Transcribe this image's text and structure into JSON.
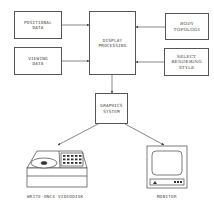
{
  "nodes": {
    "positional_data": "POSITIONAL\nDATA",
    "viewing_data": "VIEWING\nDATA",
    "display_processing": "DISPLAY\nPROCESSING",
    "body_topology": "BODY\nTOPOLOGY",
    "select_rendering_style": "SELECT\nRENDERING\nSTYLE",
    "graphics_system": "GRAPHICS\nSYSTEM"
  },
  "outputs": {
    "videodisk_label": "WRITE-ONCE VIDEODISK",
    "monitor_label": "MONITOR"
  },
  "edges": [
    {
      "from": "positional_data",
      "to": "display_processing"
    },
    {
      "from": "viewing_data",
      "to": "display_processing"
    },
    {
      "from": "body_topology",
      "to": "display_processing"
    },
    {
      "from": "select_rendering_style",
      "to": "display_processing"
    },
    {
      "from": "display_processing",
      "to": "graphics_system"
    },
    {
      "from": "graphics_system",
      "to": "write_once_videodisk"
    },
    {
      "from": "graphics_system",
      "to": "monitor"
    }
  ]
}
